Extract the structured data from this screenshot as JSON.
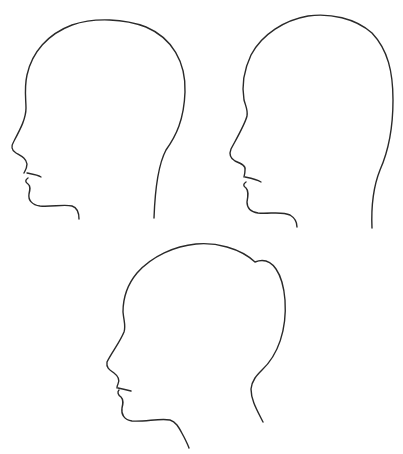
{
  "figure": {
    "background": "#ffffff",
    "stroke_color": "#2a2a2a",
    "items": [
      {
        "id": "profile-top-left",
        "label": "head profile facing left"
      },
      {
        "id": "profile-top-right",
        "label": "head profile facing left"
      },
      {
        "id": "profile-bottom-center",
        "label": "head profile facing left, tilted"
      }
    ]
  }
}
